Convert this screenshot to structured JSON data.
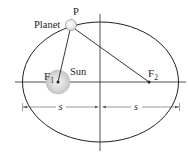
{
  "diagram": {
    "type": "ellipse-orbit",
    "labels": {
      "planet": "Planet",
      "point": "P",
      "sun": "Sun",
      "focus1_main": "F",
      "focus1_sub": "1",
      "focus2_main": "F",
      "focus2_sub": "2",
      "dim_left": "s",
      "dim_right": "s"
    },
    "colors": {
      "stroke": "#231f20",
      "sun_fill": "#d9d9d9",
      "sun_edge": "#bfbfbf",
      "planet_fill": "#ffffff",
      "dim_line": "#555555"
    }
  }
}
